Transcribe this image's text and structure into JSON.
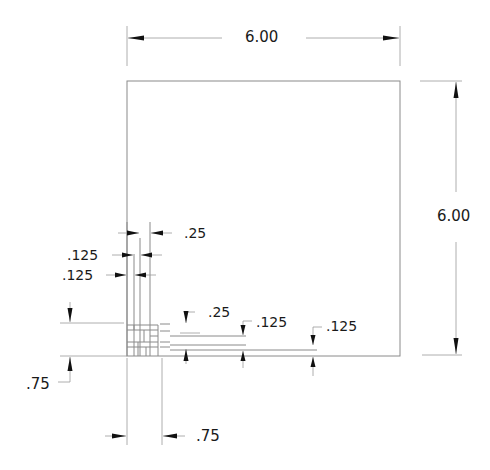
{
  "drawing": {
    "title": "Plate with woven lattice corner detail",
    "colors": {
      "geometry": "#8a8a8a",
      "dimension": "#9a9a9a",
      "arrow": "#111111",
      "text": "#1a1a1a",
      "background": "#ffffff"
    },
    "dimensions": {
      "overall_width": ".",
      "overall_width_label": "6.00",
      "overall_height_label": "6.00",
      "strip_width_top": ".25",
      "strip_gap_top_1": ".125",
      "strip_gap_top_2": ".125",
      "strip_width_right": ".25",
      "strip_gap_right_1": ".125",
      "strip_gap_right_2": ".125",
      "offset_vertical": ".75",
      "offset_horizontal": ".75"
    }
  }
}
